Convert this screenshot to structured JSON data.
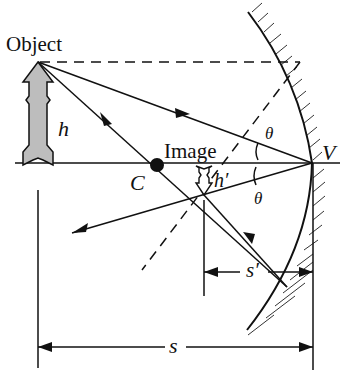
{
  "diagram": {
    "type": "concave-mirror-ray-diagram",
    "labels": {
      "object": "Object",
      "image": "Image",
      "h": "h",
      "h_prime": "h′",
      "C": "C",
      "V": "V",
      "theta_top": "θ",
      "theta_bottom": "θ",
      "s": "s",
      "s_prime": "s′"
    },
    "colors": {
      "stroke": "#111111",
      "object_fill": "#bdbdbd",
      "background": "#ffffff"
    }
  }
}
